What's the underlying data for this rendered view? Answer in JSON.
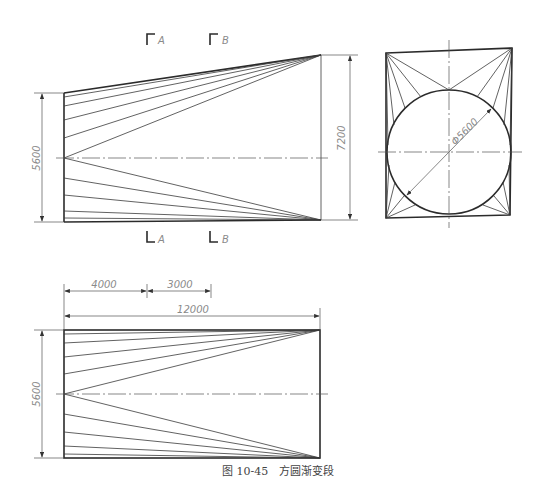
{
  "figure": {
    "caption": "图 10-45　方圆渐变段"
  },
  "front_view": {
    "name": "elevation",
    "dimensions": {
      "left_height": "5600",
      "right_height": "7200"
    },
    "section_marks": [
      {
        "label": "A"
      },
      {
        "label": "B"
      }
    ]
  },
  "side_view": {
    "name": "end-view",
    "dimensions": {
      "circle_diameter": "Φ5600"
    }
  },
  "plan_view": {
    "name": "plan",
    "dimensions": {
      "segment_1": "4000",
      "segment_2": "3000",
      "overall_length": "12000",
      "height": "5600"
    }
  }
}
